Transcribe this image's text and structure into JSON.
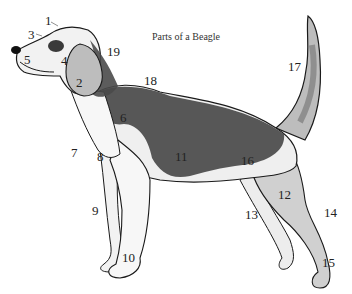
{
  "title": "Parts of a Beagle",
  "colors": {
    "outline": "#1a1a1a",
    "dark_coat": "#4a4a4a",
    "tan_coat": "#a8a8a8",
    "white_coat": "#f4f4f4",
    "light_shade": "#d6d6d6",
    "background": "#ffffff"
  },
  "labels": [
    {
      "id": "1",
      "text": "1",
      "x": 45,
      "y": 14
    },
    {
      "id": "2",
      "text": "2",
      "x": 76,
      "y": 76
    },
    {
      "id": "3",
      "text": "3",
      "x": 28,
      "y": 28
    },
    {
      "id": "4",
      "text": "4",
      "x": 61,
      "y": 54
    },
    {
      "id": "5",
      "text": "5",
      "x": 24,
      "y": 53
    },
    {
      "id": "6",
      "text": "6",
      "x": 120,
      "y": 111
    },
    {
      "id": "7",
      "text": "7",
      "x": 71,
      "y": 146
    },
    {
      "id": "8",
      "text": "8",
      "x": 97,
      "y": 150
    },
    {
      "id": "9",
      "text": "9",
      "x": 92,
      "y": 204
    },
    {
      "id": "10",
      "text": "10",
      "x": 122,
      "y": 251
    },
    {
      "id": "11",
      "text": "11",
      "x": 175,
      "y": 150
    },
    {
      "id": "12",
      "text": "12",
      "x": 278,
      "y": 188
    },
    {
      "id": "13",
      "text": "13",
      "x": 245,
      "y": 208
    },
    {
      "id": "14",
      "text": "14",
      "x": 324,
      "y": 206
    },
    {
      "id": "15",
      "text": "15",
      "x": 322,
      "y": 256
    },
    {
      "id": "16",
      "text": "16",
      "x": 241,
      "y": 154
    },
    {
      "id": "17",
      "text": "17",
      "x": 288,
      "y": 60
    },
    {
      "id": "18",
      "text": "18",
      "x": 144,
      "y": 74
    },
    {
      "id": "19",
      "text": "19",
      "x": 107,
      "y": 45
    }
  ]
}
